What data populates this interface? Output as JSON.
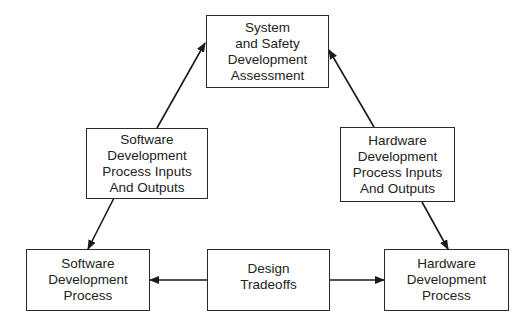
{
  "diagram": {
    "nodes": [
      {
        "id": "system",
        "label": "System\nand Safety\nDevelopment\nAssessment"
      },
      {
        "id": "sw_io",
        "label": "Software\nDevelopment\nProcess Inputs\nAnd Outputs"
      },
      {
        "id": "hw_io",
        "label": "Hardware\nDevelopment\nProcess Inputs\nAnd Outputs"
      },
      {
        "id": "sw_proc",
        "label": "Software\nDevelopment\nProcess"
      },
      {
        "id": "design",
        "label": "Design\nTradeoffs"
      },
      {
        "id": "hw_proc",
        "label": "Hardware\nDevelopment\nProcess"
      }
    ],
    "edges": [
      {
        "from": "sw_io",
        "to": "system"
      },
      {
        "from": "hw_io",
        "to": "system"
      },
      {
        "from": "sw_io",
        "to": "sw_proc"
      },
      {
        "from": "hw_io",
        "to": "hw_proc"
      },
      {
        "from": "design",
        "to": "sw_proc"
      },
      {
        "from": "design",
        "to": "hw_proc"
      }
    ],
    "colors": {
      "line": "#1a1a1a",
      "border": "#2a2a2a",
      "background": "#ffffff"
    }
  }
}
